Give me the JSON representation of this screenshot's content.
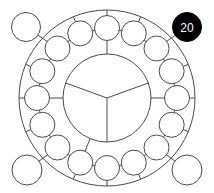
{
  "puzzle": {
    "center": [
      107,
      98
    ],
    "outer_ring_radius": 88,
    "inner_circle_radius": 44,
    "ring_circle_orbit": 70,
    "ring_circle_radius": 12.5,
    "ring_circle_count": 16,
    "inner_sector_angles_deg": [
      160,
      20,
      270
    ],
    "corner_circles": [
      {
        "id": "top-left",
        "cx": 26,
        "cy": 27,
        "r": 14.5,
        "link_angle_deg": 135,
        "filled": false,
        "label": ""
      },
      {
        "id": "top-right",
        "cx": 187,
        "cy": 27,
        "r": 14.5,
        "link_angle_deg": 45,
        "filled": true,
        "label": "20"
      },
      {
        "id": "bottom-left",
        "cx": 27,
        "cy": 170,
        "r": 15,
        "link_angle_deg": 225,
        "filled": false,
        "label": ""
      },
      {
        "id": "bottom-right",
        "cx": 187,
        "cy": 170,
        "r": 15,
        "link_angle_deg": 315,
        "filled": false,
        "label": ""
      }
    ],
    "outer_spokes_deg": [
      0,
      22.5,
      67.5,
      90,
      112.5,
      157.5,
      180,
      202.5,
      247.5,
      270,
      292.5,
      337.5
    ],
    "inner_spokes_deg": [
      0,
      90,
      180,
      247.5
    ],
    "colors": {
      "line": "#4a4a4a",
      "filled": "#000000",
      "label": "#ffffff",
      "background": "#ffffff"
    }
  }
}
